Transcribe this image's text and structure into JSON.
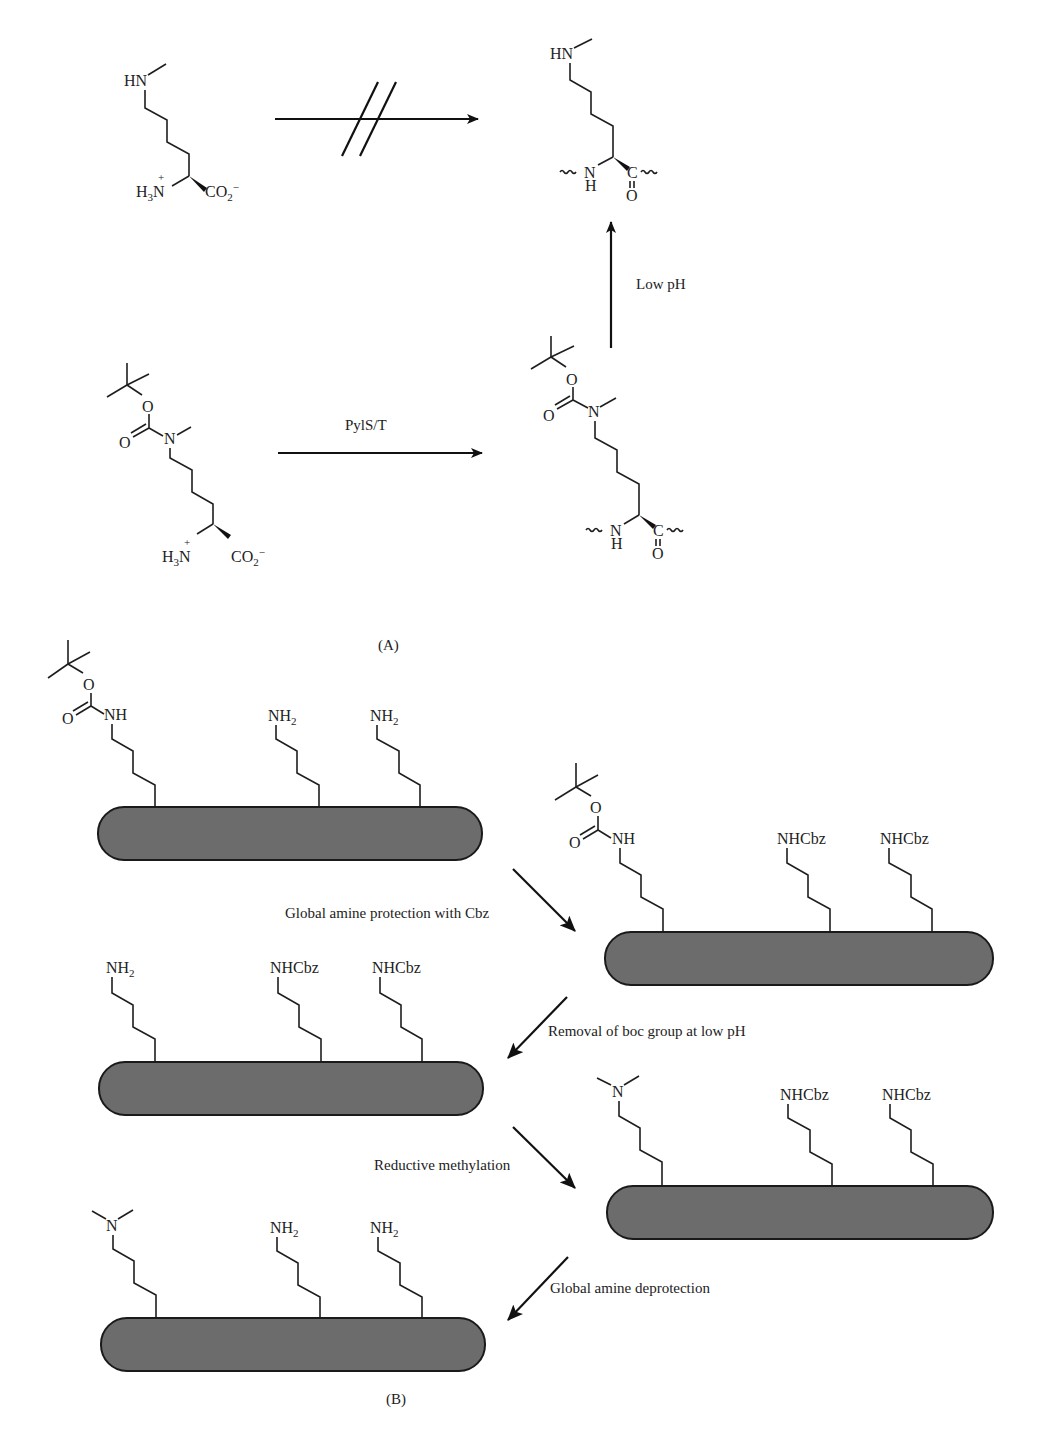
{
  "figure": {
    "panel_a": {
      "label": "(A)",
      "lysine_nme": {
        "top_group": "HN",
        "amine": "H3N+",
        "carboxylate": "CO2−"
      },
      "peptide_lysine_nme": {
        "top_group": "HN",
        "backbone_n": "N",
        "backbone_h": "H",
        "backbone_c": "C",
        "backbone_o": "O"
      },
      "boc_lysine": {
        "carbonyl_o": "O",
        "ester_o": "O",
        "n": "N",
        "amine": "H3N+",
        "carboxylate": "CO2−"
      },
      "peptide_boc_lysine": {
        "carbonyl_o": "O",
        "ester_o": "O",
        "n": "N",
        "backbone_n": "N",
        "backbone_h": "H",
        "backbone_c": "C",
        "backbone_o": "O"
      },
      "arrows": [
        {
          "id": "blocked",
          "label": "",
          "note": "crossed-out arrow"
        },
        {
          "id": "pyls",
          "label": "PylS/T"
        },
        {
          "id": "low-ph",
          "label": "Low pH"
        }
      ]
    },
    "panel_b": {
      "label": "(B)",
      "rods": [
        {
          "id": "rod1",
          "groups": [
            "Boc-NH",
            "NH2",
            "NH2"
          ]
        },
        {
          "id": "rod2",
          "groups": [
            "Boc-NH",
            "NHCbz",
            "NHCbz"
          ]
        },
        {
          "id": "rod3",
          "groups": [
            "NH2",
            "NHCbz",
            "NHCbz"
          ]
        },
        {
          "id": "rod4",
          "groups": [
            "NMe2",
            "NHCbz",
            "NHCbz"
          ]
        },
        {
          "id": "rod5",
          "groups": [
            "NMe2",
            "NH2",
            "NH2"
          ]
        }
      ],
      "labels": {
        "nh": "NH",
        "nh2_main": "NH",
        "nh2_sub": "2",
        "nhcbz": "NHCbz",
        "n": "N",
        "o": "O"
      },
      "steps": [
        {
          "label": "Global amine protection with Cbz"
        },
        {
          "label": "Removal of boc group at low pH"
        },
        {
          "label": "Reductive methylation"
        },
        {
          "label": "Global amine deprotection"
        }
      ]
    },
    "colors": {
      "rod_fill": "#6c6c6c",
      "line": "#1e1e1e",
      "background": "#ffffff"
    }
  }
}
